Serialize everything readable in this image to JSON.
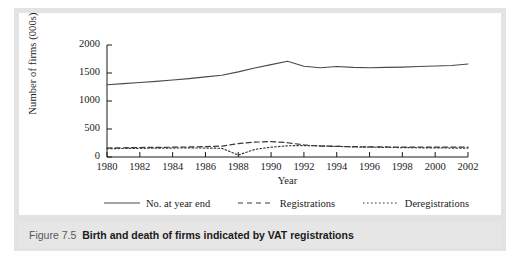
{
  "figure": {
    "caption_number": "Figure 7.5",
    "caption_text": "Birth and death of firms indicated by VAT registrations"
  },
  "chart_data": {
    "type": "line",
    "title": "",
    "xlabel": "Year",
    "ylabel": "Number of firms (000s)",
    "xlim": [
      1980,
      2002
    ],
    "ylim": [
      0,
      2000
    ],
    "xticks": [
      1980,
      1982,
      1984,
      1986,
      1988,
      1990,
      1992,
      1994,
      1996,
      1998,
      2000,
      2002
    ],
    "xtick_labels": [
      "1980",
      "1982",
      "1984",
      "1986",
      "1988",
      "1990",
      "1992",
      "1994",
      "1996",
      "1998",
      "2000",
      "2002"
    ],
    "yticks": [
      0,
      500,
      1000,
      1500,
      2000
    ],
    "ytick_labels": [
      "0",
      "500",
      "1000",
      "1500",
      "2000"
    ],
    "grid": false,
    "legend_position": "below",
    "x": [
      1980,
      1981,
      1982,
      1983,
      1984,
      1985,
      1986,
      1987,
      1988,
      1989,
      1990,
      1991,
      1992,
      1993,
      1994,
      1995,
      1996,
      1997,
      1998,
      1999,
      2000,
      2001,
      2002
    ],
    "series": [
      {
        "name": "No. at year end",
        "style": "solid",
        "color": "#4a4a4a",
        "values": [
          1290,
          1310,
          1330,
          1350,
          1375,
          1400,
          1430,
          1460,
          1520,
          1590,
          1650,
          1710,
          1620,
          1595,
          1615,
          1600,
          1595,
          1600,
          1605,
          1615,
          1625,
          1635,
          1660
        ]
      },
      {
        "name": "Registrations",
        "style": "dashed",
        "color": "#3a3a3a",
        "values": [
          160,
          165,
          170,
          172,
          175,
          180,
          185,
          195,
          240,
          265,
          275,
          255,
          215,
          195,
          190,
          185,
          180,
          180,
          175,
          175,
          175,
          175,
          175
        ]
      },
      {
        "name": "Deregistrations",
        "style": "dotted",
        "color": "#3a3a3a",
        "values": [
          150,
          152,
          155,
          158,
          160,
          162,
          160,
          155,
          35,
          135,
          175,
          200,
          205,
          200,
          190,
          180,
          175,
          172,
          168,
          165,
          162,
          160,
          160
        ]
      }
    ]
  }
}
